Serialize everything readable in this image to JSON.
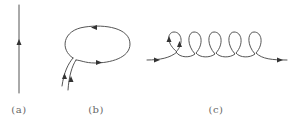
{
  "diagram": {
    "panels": [
      {
        "id": "a",
        "label": "(a)",
        "description": "straight vertical line with upward arrow"
      },
      {
        "id": "b",
        "label": "(b)",
        "description": "closed loop with two parallel tails, arrows circulating"
      },
      {
        "id": "c",
        "label": "(c)",
        "description": "helical / coiled line with five loops, arrows pointing right"
      }
    ],
    "colors": {
      "line": "#555555",
      "arrow": "#333333",
      "label": "#666666",
      "background": "#ffffff"
    }
  }
}
